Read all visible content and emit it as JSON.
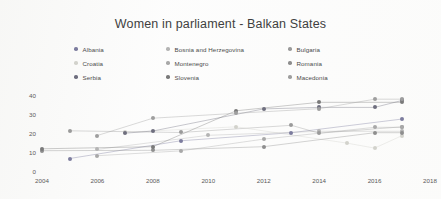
{
  "chart_data": {
    "type": "line",
    "title": "Women in parliament - Balkan States",
    "xlabel": "",
    "ylabel": "",
    "xlim": [
      2004,
      2018
    ],
    "ylim": [
      0,
      40
    ],
    "xticks": [
      "2004",
      "2006",
      "2008",
      "2010",
      "2012",
      "2014",
      "2016",
      "2018"
    ],
    "yticks": [
      "0",
      "10",
      "20",
      "30",
      "40"
    ],
    "grid": false,
    "legend_position": "top",
    "series": [
      {
        "name": "Albania",
        "color": "#7c7c9e",
        "x": [
          2005,
          2009,
          2013,
          2017
        ],
        "values": [
          7.1,
          16.4,
          20.7,
          27.9
        ]
      },
      {
        "name": "Bosnia and Herzegovina",
        "color": "#b4b4b4",
        "x": [
          2006,
          2010,
          2014,
          2017
        ],
        "values": [
          11.9,
          19.3,
          21.4,
          21.4
        ]
      },
      {
        "name": "Bulgaria",
        "color": "#9a9a9a",
        "x": [
          2005,
          2009,
          2013,
          2014,
          2017
        ],
        "values": [
          21.7,
          20.8,
          24.6,
          20.4,
          23.8
        ]
      },
      {
        "name": "Croatia",
        "color": "#d2d2cc",
        "x": [
          2007,
          2011,
          2015,
          2016,
          2017
        ],
        "values": [
          20.9,
          23.8,
          15.2,
          12.6,
          19.2
        ]
      },
      {
        "name": "Montenegro",
        "color": "#a8a8a8",
        "x": [
          2006,
          2009,
          2012,
          2016,
          2017
        ],
        "values": [
          8.6,
          11.1,
          17.3,
          23.5,
          23.5
        ]
      },
      {
        "name": "Romania",
        "color": "#8e8e8e",
        "x": [
          2004,
          2008,
          2012,
          2016,
          2017
        ],
        "values": [
          11.2,
          11.4,
          13.3,
          20.7,
          20.7
        ]
      },
      {
        "name": "Serbia",
        "color": "#6e6e7e",
        "x": [
          2007,
          2008,
          2012,
          2014,
          2016,
          2017
        ],
        "values": [
          20.4,
          21.6,
          33.2,
          34.0,
          34.0,
          37.7
        ]
      },
      {
        "name": "Slovenia",
        "color": "#7a7a7a",
        "x": [
          2004,
          2008,
          2011,
          2014,
          2017
        ],
        "values": [
          12.2,
          13.3,
          32.2,
          36.7,
          36.7
        ]
      },
      {
        "name": "Macedonia",
        "color": "#9e9e9e",
        "x": [
          2006,
          2008,
          2011,
          2014,
          2016,
          2017
        ],
        "values": [
          19.2,
          28.3,
          30.9,
          33.3,
          38.3,
          38.3
        ]
      }
    ]
  },
  "legend": {
    "items": [
      {
        "label": "Albania",
        "color": "#7c7c9e"
      },
      {
        "label": "Bosnia and Herzegovina",
        "color": "#b4b4b4"
      },
      {
        "label": "Bulgaria",
        "color": "#9a9a9a"
      },
      {
        "label": "Croatia",
        "color": "#d2d2cc"
      },
      {
        "label": "Montenegro",
        "color": "#a8a8a8"
      },
      {
        "label": "Romania",
        "color": "#8e8e8e"
      },
      {
        "label": "Serbia",
        "color": "#6e6e7e"
      },
      {
        "label": "Slovenia",
        "color": "#7a7a7a"
      },
      {
        "label": "Macedonia",
        "color": "#9e9e9e"
      }
    ]
  }
}
